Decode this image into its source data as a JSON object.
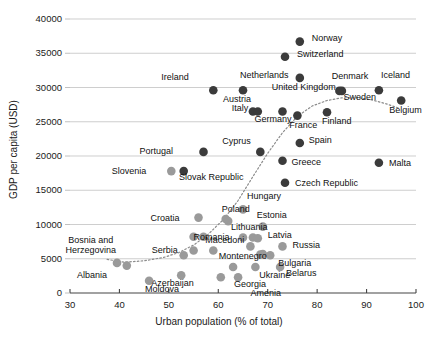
{
  "chart_data": {
    "type": "scatter",
    "title": "",
    "xlabel": "Urban population (% of total)",
    "ylabel": "GDP per capita (USD)",
    "xlim": [
      30,
      100
    ],
    "ylim": [
      0,
      40000
    ],
    "xticks": [
      "30",
      "40",
      "50",
      "60",
      "70",
      "80",
      "90",
      "100"
    ],
    "yticks": [
      "0",
      "5000",
      "10000",
      "15000",
      "20000",
      "25000",
      "30000",
      "35000",
      "40000"
    ],
    "grid": "horizontal",
    "legend": "none",
    "marker_colors": {
      "dark": "#3b3b3b",
      "light": "#9a9a9a"
    },
    "trendline": {
      "style": "dotted",
      "color": "#8c8c8c",
      "points": [
        [
          37.5,
          4900
        ],
        [
          41,
          4500
        ],
        [
          45,
          4700
        ],
        [
          49,
          5200
        ],
        [
          52,
          5900
        ],
        [
          55,
          7000
        ],
        [
          58,
          8600
        ],
        [
          61,
          10700
        ],
        [
          64,
          13500
        ],
        [
          67,
          17000
        ],
        [
          70,
          20400
        ],
        [
          73,
          23400
        ],
        [
          76,
          25800
        ],
        [
          79,
          27300
        ],
        [
          82,
          28100
        ],
        [
          85,
          28500
        ],
        [
          88,
          28500
        ],
        [
          91,
          28200
        ],
        [
          94,
          27600
        ],
        [
          96.5,
          27000
        ]
      ]
    },
    "points": [
      {
        "name": "Norway",
        "x": 76.5,
        "y": 36700,
        "shade": "dark",
        "lx": 12,
        "ly": -4
      },
      {
        "name": "Switzerland",
        "x": 73.5,
        "y": 34500,
        "shade": "dark",
        "lx": 12,
        "ly": -3
      },
      {
        "name": "Netherlands",
        "x": 65.0,
        "y": 29600,
        "shade": "dark",
        "lx": -3,
        "ly": -15
      },
      {
        "name": "Ireland",
        "x": 59.0,
        "y": 29600,
        "shade": "dark",
        "lx": -52,
        "ly": -13
      },
      {
        "name": "Denmark",
        "x": 85.0,
        "y": 29500,
        "shade": "dark",
        "lx": -10,
        "ly": -15
      },
      {
        "name": "Iceland",
        "x": 92.5,
        "y": 29600,
        "shade": "dark",
        "lx": 2,
        "ly": -15
      },
      {
        "name": "United Kingdom",
        "x": 76.5,
        "y": 31400,
        "shade": "dark",
        "lx": -28,
        "ly": 9
      },
      {
        "name": "Sweden",
        "x": 84.5,
        "y": 29500,
        "shade": "dark",
        "lx": 4,
        "ly": 6
      },
      {
        "name": "Austria",
        "x": 67.0,
        "y": 26500,
        "shade": "dark",
        "lx": -30,
        "ly": -12
      },
      {
        "name": "Italy",
        "x": 68.0,
        "y": 26500,
        "shade": "dark",
        "lx": -26,
        "ly": -3
      },
      {
        "name": "Germany",
        "x": 73.0,
        "y": 26500,
        "shade": "dark",
        "lx": -28,
        "ly": 8
      },
      {
        "name": "France",
        "x": 76.0,
        "y": 25900,
        "shade": "dark",
        "lx": -8,
        "ly": 9
      },
      {
        "name": "Finland",
        "x": 82.0,
        "y": 26400,
        "shade": "dark",
        "lx": -5,
        "ly": 9
      },
      {
        "name": "Belgium",
        "x": 97.0,
        "y": 28100,
        "shade": "dark",
        "lx": -12,
        "ly": 9
      },
      {
        "name": "Spain",
        "x": 76.5,
        "y": 21900,
        "shade": "dark",
        "lx": 9,
        "ly": -3
      },
      {
        "name": "Cyprus",
        "x": 68.5,
        "y": 20600,
        "shade": "dark",
        "lx": -38,
        "ly": -11
      },
      {
        "name": "Portugal",
        "x": 57.0,
        "y": 20600,
        "shade": "dark",
        "lx": -64,
        "ly": -1
      },
      {
        "name": "Greece",
        "x": 73.0,
        "y": 19300,
        "shade": "dark",
        "lx": 9,
        "ly": 1
      },
      {
        "name": "Malta",
        "x": 92.5,
        "y": 19000,
        "shade": "dark",
        "lx": 10,
        "ly": 0
      },
      {
        "name": "Czech Republic",
        "x": 73.5,
        "y": 16100,
        "shade": "dark",
        "lx": 10,
        "ly": 0
      },
      {
        "name": "Slovenia",
        "x": 53.0,
        "y": 17800,
        "shade": "dark",
        "lx": -72,
        "ly": 0
      },
      {
        "name": "Slovenia2",
        "x": 50.5,
        "y": 17800,
        "shade": "light",
        "lx": 0,
        "ly": 0,
        "hide_label": true
      },
      {
        "name": "Slovak Republic",
        "x": 56.5,
        "y": 14900,
        "shade": "light",
        "lx": -22,
        "ly": -14,
        "hide_marker": true
      },
      {
        "name": "Hungary",
        "x": 65.0,
        "y": 12200,
        "shade": "light",
        "lx": 4,
        "ly": -13
      },
      {
        "name": "Poland",
        "x": 61.5,
        "y": 10800,
        "shade": "light",
        "lx": -4,
        "ly": -10
      },
      {
        "name": "Croatia",
        "x": 56.0,
        "y": 11000,
        "shade": "light",
        "lx": -48,
        "ly": 0
      },
      {
        "name": "Estonia",
        "x": 69.0,
        "y": 9700,
        "shade": "light",
        "lx": -6,
        "ly": -12
      },
      {
        "name": "Lithuania",
        "x": 67.0,
        "y": 8100,
        "shade": "light",
        "lx": -22,
        "ly": -11
      },
      {
        "name": "Latvia",
        "x": 68.0,
        "y": 8000,
        "shade": "light",
        "lx": 10,
        "ly": -3
      },
      {
        "name": "Macedoni",
        "x": 59.0,
        "y": 6200,
        "shade": "light",
        "lx": -8,
        "ly": -11
      },
      {
        "name": "Serbia",
        "x": 53.0,
        "y": 5500,
        "shade": "light",
        "lx": -32,
        "ly": -5
      },
      {
        "name": "Montenegro",
        "x": 69.0,
        "y": 5700,
        "shade": "light",
        "lx": -44,
        "ly": 2
      },
      {
        "name": "Russia",
        "x": 73.0,
        "y": 6800,
        "shade": "light",
        "lx": 10,
        "ly": -1
      },
      {
        "name": "Bulgaria",
        "x": 70.5,
        "y": 5500,
        "shade": "light",
        "lx": 8,
        "ly": 8
      },
      {
        "name": "Romania",
        "x": 55.0,
        "y": 8200,
        "shade": "light",
        "lx": 0,
        "ly": 0,
        "hide_marker": false,
        "label_only_pos": true
      },
      {
        "name": "Belarus",
        "x": 72.5,
        "y": 3800,
        "shade": "light",
        "lx": 6,
        "ly": 6
      },
      {
        "name": "Ukraine",
        "x": 67.5,
        "y": 3800,
        "shade": "light",
        "lx": 4,
        "ly": 8
      },
      {
        "name": "Georgia",
        "x": 64.0,
        "y": 2300,
        "shade": "light",
        "lx": -4,
        "ly": 7
      },
      {
        "name": "Amenia",
        "x": 64.5,
        "y": 2300,
        "shade": "light",
        "lx": 10,
        "ly": 16,
        "hide_marker": true
      },
      {
        "name": "Azerbaijan",
        "x": 52.5,
        "y": 2600,
        "shade": "light",
        "lx": -30,
        "ly": 8
      },
      {
        "name": "Moldova",
        "x": 46.0,
        "y": 1800,
        "shade": "light",
        "lx": -4,
        "ly": 8
      },
      {
        "name": "Albania",
        "x": 39.5,
        "y": 4400,
        "shade": "light",
        "lx": -40,
        "ly": 12
      },
      {
        "name": "Bosnia and Herzegovina",
        "x": 41.5,
        "y": 4000,
        "shade": "light",
        "lx": -36,
        "ly": -26,
        "two_line": true
      }
    ],
    "extra_markers": [
      {
        "x": 55.0,
        "y": 6200,
        "shade": "light"
      },
      {
        "x": 57.0,
        "y": 8200,
        "shade": "light"
      },
      {
        "x": 62.0,
        "y": 10500,
        "shade": "light"
      },
      {
        "x": 65.0,
        "y": 8100,
        "shade": "light"
      },
      {
        "x": 66.5,
        "y": 6800,
        "shade": "light"
      },
      {
        "x": 68.5,
        "y": 5600,
        "shade": "light"
      },
      {
        "x": 63.0,
        "y": 3800,
        "shade": "light"
      },
      {
        "x": 60.5,
        "y": 2300,
        "shade": "light"
      }
    ]
  }
}
